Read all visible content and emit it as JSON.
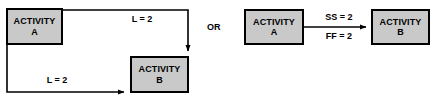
{
  "diagram": {
    "connector_label": "OR",
    "colors": {
      "box_fill": "#c9c9c9",
      "box_border": "#000000",
      "line": "#000000",
      "text": "#000000",
      "background": "#ffffff"
    },
    "left_variant": {
      "name": "lag-notation",
      "nodes": [
        {
          "id": "A",
          "line1": "ACTIVITY",
          "line2": "A"
        },
        {
          "id": "B",
          "line1": "ACTIVITY",
          "line2": "B"
        }
      ],
      "edges": [
        {
          "id": "a-finish-to-b-start-top",
          "label": "L = 2",
          "from": "A",
          "to": "B"
        },
        {
          "id": "a-start-to-b-start-bottom",
          "label": "L = 2",
          "from": "A",
          "to": "B"
        }
      ]
    },
    "right_variant": {
      "name": "ss-ff-notation",
      "nodes": [
        {
          "id": "A",
          "line1": "ACTIVITY",
          "line2": "A"
        },
        {
          "id": "B",
          "line1": "ACTIVITY",
          "line2": "B"
        }
      ],
      "edges": [
        {
          "id": "a-to-b",
          "label_above": "SS = 2",
          "label_below": "FF = 2",
          "from": "A",
          "to": "B"
        }
      ]
    }
  }
}
